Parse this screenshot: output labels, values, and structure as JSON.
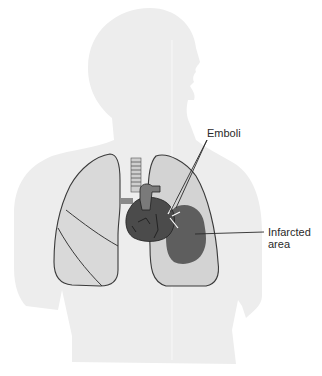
{
  "figure": {
    "labels": {
      "emboli": "Emboli",
      "infarcted_line1": "Infarcted",
      "infarcted_line2": "area"
    },
    "colors": {
      "background": "#ffffff",
      "silhouette": "#ededed",
      "lung_fill": "#d8d8d8",
      "lung_outline": "#3a3a3a",
      "heart": "#4a4a4a",
      "infarct": "#5f5f5f",
      "text": "#2a2a2a"
    }
  }
}
